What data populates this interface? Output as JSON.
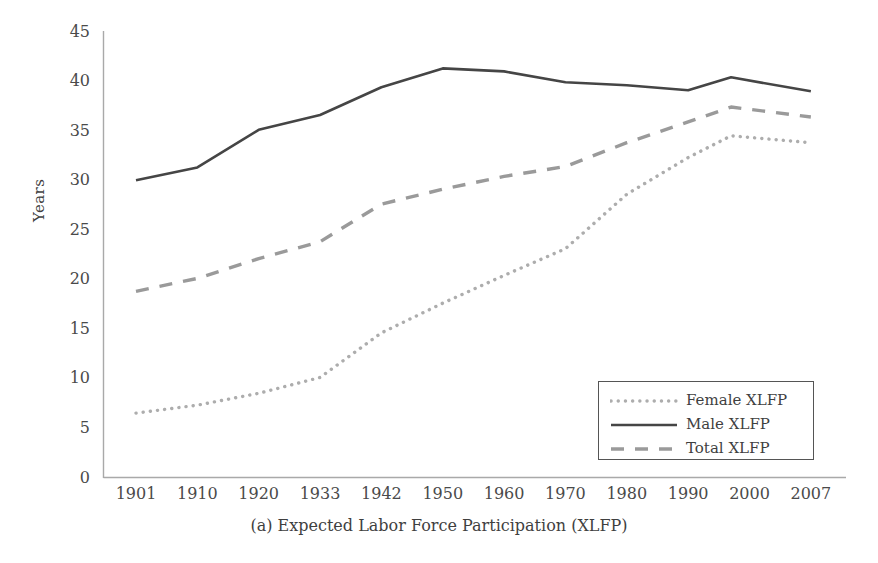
{
  "figure": {
    "caption": "(a) Expected Labor Force Participation (XLFP)",
    "ylabel": "Years"
  },
  "legend": {
    "items": [
      {
        "label": "Female XLFP",
        "style": "dotted",
        "color": "#adadad"
      },
      {
        "label": "Male XLFP",
        "style": "solid",
        "color": "#454545"
      },
      {
        "label": "Total XLFP",
        "style": "dashed",
        "color": "#9a9a9a"
      }
    ]
  },
  "axes": {
    "y_ticks": [
      "0",
      "5",
      "10",
      "15",
      "20",
      "25",
      "30",
      "35",
      "40",
      "45"
    ],
    "x_ticks": [
      "1901",
      "1910",
      "1920",
      "1933",
      "1942",
      "1950",
      "1960",
      "1970",
      "1980",
      "1990",
      "2000",
      "2007"
    ]
  },
  "chart_data": {
    "type": "line",
    "title": "(a) Expected Labor Force Participation (XLFP)",
    "xlabel": "",
    "ylabel": "Years",
    "ylim": [
      0,
      45
    ],
    "grid": false,
    "legend_position": "bottom-right",
    "categories": [
      "1901",
      "1910",
      "1920",
      "1933",
      "1942",
      "1950",
      "1960",
      "1970",
      "1980",
      "1990",
      "1997",
      "2007"
    ],
    "series": [
      {
        "name": "Female XLFP",
        "style": "dotted",
        "color": "#adadad",
        "values": [
          6.5,
          7.3,
          8.5,
          10.1,
          14.6,
          17.6,
          20.4,
          23.1,
          28.6,
          32.3,
          34.5,
          33.8
        ]
      },
      {
        "name": "Male XLFP",
        "style": "solid",
        "color": "#454545",
        "values": [
          30.0,
          31.3,
          35.1,
          36.6,
          39.4,
          41.3,
          41.0,
          39.9,
          39.6,
          39.1,
          40.4,
          39.0
        ]
      },
      {
        "name": "Total XLFP",
        "style": "dashed",
        "color": "#9a9a9a",
        "values": [
          18.8,
          20.1,
          22.1,
          23.8,
          27.6,
          29.1,
          30.4,
          31.4,
          33.8,
          35.9,
          37.4,
          36.4
        ]
      }
    ]
  }
}
